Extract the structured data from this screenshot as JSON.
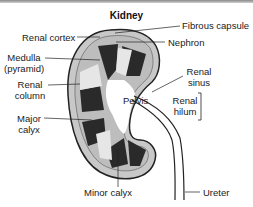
{
  "title": "Kidney",
  "labels": {
    "renal_cortex": "Renal cortex",
    "fibrous_capsule": "Fibrous capsule",
    "nephron": "Nephron",
    "medulla": "Medulla",
    "medulla_sub": "(pyramid)",
    "renal_column_1": "Renal",
    "renal_column_2": "column",
    "renal_sinus_1": "Renal",
    "renal_sinus_2": "sinus",
    "pelvis": "Pelvis",
    "renal_hilum_1": "Renal",
    "renal_hilum_2": "hilum",
    "major_calyx_1": "Major",
    "major_calyx_2": "calyx",
    "minor_calyx": "Minor calyx",
    "ureter": "Ureter"
  },
  "colors": {
    "cortex": "#c8c8c8",
    "medulla_dark": "#2a2a2a",
    "column_light": "#e6e6e6",
    "outline": "#222222"
  }
}
